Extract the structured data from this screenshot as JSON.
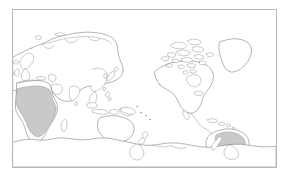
{
  "figure": {
    "type": "world-map",
    "projection": "pacific-centered-equirectangular",
    "background_color": "#ffffff",
    "frame_color": "#b9b9b9",
    "coastline_color": "#5a5a5a",
    "land_fill": "#ffffff",
    "highlight_fill": "#c9c9c9",
    "highlight_stroke": "#8a8a8a"
  },
  "map": {
    "frame": {
      "x": 12,
      "y": 9,
      "width": 265,
      "height": 159
    },
    "continents": [
      {
        "id": "eurasia",
        "name": "Eurasia",
        "shaded": false
      },
      {
        "id": "africa",
        "name": "Africa",
        "shaded": true
      },
      {
        "id": "north-america",
        "name": "North America",
        "shaded": false
      },
      {
        "id": "south-america",
        "name": "South America",
        "shaded": true
      },
      {
        "id": "australia",
        "name": "Australia",
        "shaded": false
      },
      {
        "id": "antarctica",
        "name": "Antarctica",
        "shaded": false
      },
      {
        "id": "greenland",
        "name": "Greenland",
        "shaded": false
      }
    ],
    "highlighted_regions": [
      {
        "id": "sub-saharan-africa",
        "name": "Sub-Saharan Africa",
        "fill": "#c9c9c9"
      },
      {
        "id": "amazon-south-america",
        "name": "Tropical South America",
        "fill": "#c9c9c9"
      }
    ],
    "islands": [
      {
        "id": "madagascar",
        "name": "Madagascar"
      },
      {
        "id": "japan",
        "name": "Japan"
      },
      {
        "id": "new-zealand",
        "name": "New Zealand"
      },
      {
        "id": "iceland",
        "name": "Iceland"
      },
      {
        "id": "british-isles",
        "name": "British Isles"
      },
      {
        "id": "philippines",
        "name": "Philippines"
      },
      {
        "id": "indonesia",
        "name": "Indonesia"
      },
      {
        "id": "caribbean",
        "name": "Caribbean Islands"
      },
      {
        "id": "canadian-arctic",
        "name": "Canadian Arctic Archipelago"
      },
      {
        "id": "new-guinea",
        "name": "New Guinea"
      },
      {
        "id": "sri-lanka",
        "name": "Sri Lanka"
      },
      {
        "id": "taiwan",
        "name": "Taiwan"
      },
      {
        "id": "hawaii",
        "name": "Hawaii"
      },
      {
        "id": "svalbard",
        "name": "Svalbard"
      },
      {
        "id": "novaya-zemlya",
        "name": "Novaya Zemlya"
      }
    ]
  }
}
